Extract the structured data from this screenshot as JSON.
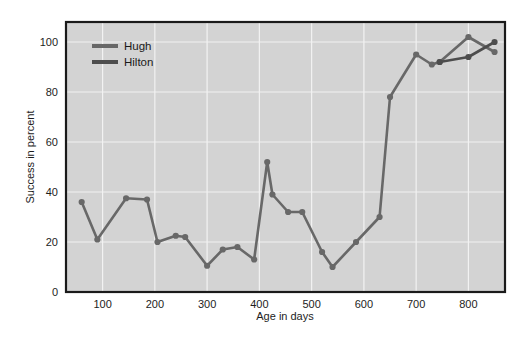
{
  "figure": {
    "background_color": "#ffffff",
    "plot_background_color": "#d3d3d3",
    "plot_border_color": "#1a1a1a",
    "gridline_color": "#f2f2f2",
    "series_color": "#4d4d4d"
  },
  "axes": {
    "x_title": "Age in days",
    "y_title": "Success in percent",
    "x_ticks": [
      "100",
      "200",
      "300",
      "400",
      "500",
      "600",
      "700",
      "800"
    ],
    "y_ticks": [
      "0",
      "20",
      "40",
      "60",
      "80",
      "100"
    ]
  },
  "legend": {
    "items": [
      {
        "label": "Hugh",
        "color": "#686868"
      },
      {
        "label": "Hilton",
        "color": "#4d4d4d"
      }
    ]
  },
  "chart_data": {
    "type": "line",
    "title": "",
    "xlabel": "Age in days",
    "ylabel": "Success in percent",
    "xlim": [
      30,
      870
    ],
    "ylim": [
      0,
      108
    ],
    "xticks": [
      100,
      200,
      300,
      400,
      500,
      600,
      700,
      800
    ],
    "yticks": [
      0,
      20,
      40,
      60,
      80,
      100
    ],
    "grid": true,
    "legend_position": "upper-left-inside",
    "markers": true,
    "series": [
      {
        "name": "Hugh",
        "color": "#686868",
        "x": [
          60,
          90,
          145,
          185,
          205,
          240,
          258,
          300,
          330,
          358,
          390,
          415,
          425,
          455,
          482,
          520,
          540,
          585,
          630,
          650,
          700,
          730,
          745,
          800,
          850
        ],
        "y": [
          36,
          21,
          37.5,
          37,
          20,
          22.5,
          22,
          10.5,
          17,
          18,
          13,
          52,
          39,
          32,
          32,
          16,
          10,
          20,
          30,
          78,
          95,
          91,
          92,
          102,
          96
        ]
      },
      {
        "name": "Hilton",
        "color": "#4d4d4d",
        "x": [
          745,
          800,
          850
        ],
        "y": [
          92,
          94,
          100
        ]
      }
    ]
  }
}
